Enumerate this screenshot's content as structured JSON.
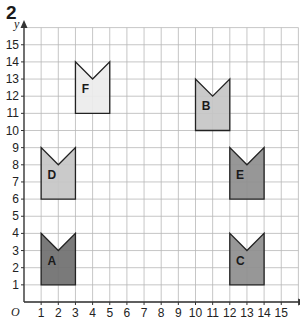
{
  "question_number": "2",
  "grid": {
    "x_min": 0,
    "x_max": 16,
    "y_min": 0,
    "y_max": 16,
    "origin_px": [
      24,
      302
    ],
    "unit_px": 17.15,
    "line_color": "#b8b8b8",
    "axis_color": "#333333"
  },
  "axes": {
    "x_label": "x",
    "y_label": "y",
    "origin_label": "O",
    "x_ticks": [
      "1",
      "2",
      "3",
      "4",
      "5",
      "6",
      "7",
      "8",
      "9",
      "10",
      "11",
      "12",
      "13",
      "14",
      "15"
    ],
    "y_ticks": [
      "1",
      "2",
      "3",
      "4",
      "5",
      "6",
      "7",
      "8",
      "9",
      "10",
      "11",
      "12",
      "13",
      "14",
      "15"
    ]
  },
  "shapes": [
    {
      "label": "A",
      "fill": "#6f6f6f",
      "points": [
        [
          1,
          1
        ],
        [
          3,
          1
        ],
        [
          3,
          4
        ],
        [
          2,
          3
        ],
        [
          1,
          4
        ]
      ],
      "label_pos": [
        1.6,
        2.4
      ]
    },
    {
      "label": "B",
      "fill": "#c6c6c6",
      "points": [
        [
          10,
          10
        ],
        [
          12,
          10
        ],
        [
          12,
          13
        ],
        [
          11,
          12
        ],
        [
          10,
          13
        ]
      ],
      "label_pos": [
        10.6,
        11.4
      ]
    },
    {
      "label": "C",
      "fill": "#8e8e8e",
      "points": [
        [
          12,
          1
        ],
        [
          14,
          1
        ],
        [
          14,
          4
        ],
        [
          13,
          3
        ],
        [
          12,
          4
        ]
      ],
      "label_pos": [
        12.6,
        2.4
      ]
    },
    {
      "label": "D",
      "fill": "#c6c6c6",
      "points": [
        [
          1,
          6
        ],
        [
          3,
          6
        ],
        [
          3,
          9
        ],
        [
          2,
          8
        ],
        [
          1,
          9
        ]
      ],
      "label_pos": [
        1.6,
        7.4
      ]
    },
    {
      "label": "E",
      "fill": "#8e8e8e",
      "points": [
        [
          12,
          6
        ],
        [
          14,
          6
        ],
        [
          14,
          9
        ],
        [
          13,
          8
        ],
        [
          12,
          9
        ]
      ],
      "label_pos": [
        12.6,
        7.4
      ]
    },
    {
      "label": "F",
      "fill": "#ececec",
      "points": [
        [
          3,
          11
        ],
        [
          5,
          11
        ],
        [
          5,
          14
        ],
        [
          4,
          13
        ],
        [
          3,
          14
        ]
      ],
      "label_pos": [
        3.6,
        12.4
      ]
    }
  ],
  "chart_data": {
    "type": "scatter",
    "title": "",
    "xlabel": "x",
    "ylabel": "y",
    "xlim": [
      0,
      16
    ],
    "ylim": [
      0,
      16
    ],
    "grid": true,
    "series": [
      {
        "name": "A",
        "vertices": [
          [
            1,
            1
          ],
          [
            3,
            1
          ],
          [
            3,
            4
          ],
          [
            2,
            3
          ],
          [
            1,
            4
          ]
        ]
      },
      {
        "name": "B",
        "vertices": [
          [
            10,
            10
          ],
          [
            12,
            10
          ],
          [
            12,
            13
          ],
          [
            11,
            12
          ],
          [
            10,
            13
          ]
        ]
      },
      {
        "name": "C",
        "vertices": [
          [
            12,
            1
          ],
          [
            14,
            1
          ],
          [
            14,
            4
          ],
          [
            13,
            3
          ],
          [
            12,
            4
          ]
        ]
      },
      {
        "name": "D",
        "vertices": [
          [
            1,
            6
          ],
          [
            3,
            6
          ],
          [
            3,
            9
          ],
          [
            2,
            8
          ],
          [
            1,
            9
          ]
        ]
      },
      {
        "name": "E",
        "vertices": [
          [
            12,
            6
          ],
          [
            14,
            6
          ],
          [
            14,
            9
          ],
          [
            13,
            8
          ],
          [
            12,
            9
          ]
        ]
      },
      {
        "name": "F",
        "vertices": [
          [
            3,
            11
          ],
          [
            5,
            11
          ],
          [
            5,
            14
          ],
          [
            4,
            13
          ],
          [
            3,
            14
          ]
        ]
      }
    ]
  }
}
